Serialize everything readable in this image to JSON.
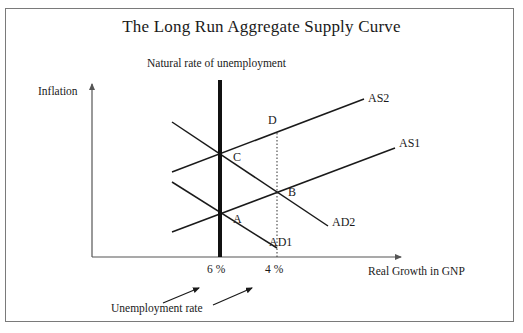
{
  "figure": {
    "title": "The Long Run Aggregate Supply Curve",
    "border_color": "#7a7a7a",
    "background": "#ffffff",
    "line_color": "#1a1a1a"
  },
  "axes": {
    "y_label": "Inflation",
    "x_label": "Real Growth in GNP",
    "origin": {
      "x": 92,
      "y": 257
    },
    "x_end": {
      "x": 405,
      "y": 257
    },
    "y_top": {
      "x": 92,
      "y": 80
    },
    "axis_color": "#555555"
  },
  "vertical_line": {
    "name": "natural-rate-of-unemployment-line",
    "label": "Natural rate of unemployment",
    "x": 220,
    "y_top": 80,
    "y_bottom": 257,
    "thickness": 4,
    "color": "#111111"
  },
  "dotted_line": {
    "name": "four-percent-guide-line",
    "x": 277,
    "y_top": 133,
    "y_bottom": 257,
    "color": "#444444"
  },
  "curves": [
    {
      "name": "AS1",
      "label": "AS1",
      "type": "aggregate-supply",
      "x1": 172,
      "y1": 232,
      "x2": 395,
      "y2": 148,
      "label_x": 399,
      "label_y": 137
    },
    {
      "name": "AS2",
      "label": "AS2",
      "type": "aggregate-supply",
      "x1": 172,
      "y1": 172,
      "x2": 364,
      "y2": 99,
      "label_x": 368,
      "label_y": 92
    },
    {
      "name": "AD1",
      "label": "AD1",
      "type": "aggregate-demand",
      "x1": 172,
      "y1": 182,
      "x2": 277,
      "y2": 248,
      "label_x": 269,
      "label_y": 236
    },
    {
      "name": "AD2",
      "label": "AD2",
      "type": "aggregate-demand",
      "x1": 172,
      "y1": 122,
      "x2": 328,
      "y2": 226,
      "label_x": 332,
      "label_y": 216
    }
  ],
  "points": [
    {
      "label": "A",
      "x": 221,
      "y": 216,
      "label_x": 233,
      "label_y": 213
    },
    {
      "label": "B",
      "x": 277,
      "y": 195,
      "label_x": 288,
      "label_y": 186
    },
    {
      "label": "C",
      "x": 221,
      "y": 155,
      "label_x": 233,
      "label_y": 151
    },
    {
      "label": "D",
      "x": 277,
      "y": 133,
      "label_x": 268,
      "label_y": 114
    }
  ],
  "ticks": [
    {
      "label": "6 %",
      "x": 207,
      "y": 264
    },
    {
      "label": "4 %",
      "x": 265,
      "y": 264
    }
  ],
  "annotation": {
    "label": "Unemployment rate",
    "label_x": 111,
    "label_y": 303,
    "arrows": [
      {
        "x1": 163,
        "y1": 303,
        "x2": 203,
        "y2": 287
      },
      {
        "x1": 213,
        "y1": 305,
        "x2": 256,
        "y2": 287
      }
    ]
  }
}
